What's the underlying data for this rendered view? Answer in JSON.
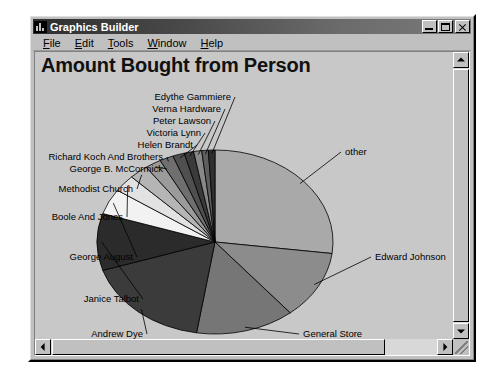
{
  "window": {
    "title": "Graphics Builder",
    "icon": "chart-bars-icon",
    "buttons": {
      "minimize": "–",
      "maximize": "□",
      "close": "×"
    }
  },
  "menu": {
    "items": [
      {
        "label": "File",
        "accel": "F"
      },
      {
        "label": "Edit",
        "accel": "E"
      },
      {
        "label": "Tools",
        "accel": "T"
      },
      {
        "label": "Window",
        "accel": "W"
      },
      {
        "label": "Help",
        "accel": "H"
      }
    ]
  },
  "chart_data": {
    "type": "pie",
    "title": "Amount Bought from Person",
    "xlabel": "",
    "ylabel": "",
    "legend_position": "none",
    "labels_placement": "outside-with-leader-lines",
    "grid": false,
    "categories": [
      "other",
      "Edward Johnson",
      "General Store",
      "Andrew Dye",
      "Janice Talbot",
      "George August",
      "Boole And Jones",
      "Methodist Church",
      "George B. McCormick",
      "Richard Koch And Brothers",
      "Helen Brandt",
      "Victoria Lynn",
      "Peter Lawson",
      "Verna Hardware",
      "Edythe Gammiere"
    ],
    "values": [
      27.0,
      12.0,
      13.5,
      17.5,
      10.0,
      4.5,
      3.0,
      2.6,
      2.2,
      1.9,
      1.6,
      1.3,
      1.1,
      0.9,
      0.9
    ],
    "unit": "percent",
    "colors": [
      "#a9a9a9",
      "#8c8c8c",
      "#767676",
      "#3b3b3b",
      "#2b2b2b",
      "#f2f2f2",
      "#e2e2e2",
      "#b5b5b5",
      "#9b9b9b",
      "#6f6f6f",
      "#4f4f4f",
      "#3a3a3a",
      "#888888",
      "#5e5e5e",
      "#303030"
    ],
    "start_angle_deg": -90,
    "direction": "clockwise"
  },
  "scrollbars": {
    "vertical": {
      "up": "up-arrow",
      "down": "down-arrow"
    },
    "horizontal": {
      "left": "left-arrow",
      "right": "right-arrow"
    }
  }
}
